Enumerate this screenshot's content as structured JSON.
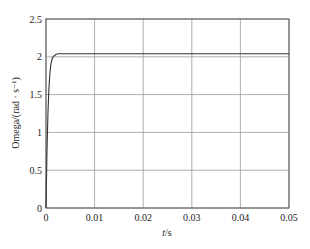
{
  "chart_data": {
    "type": "line",
    "title": "",
    "xlabel": "t/s",
    "xlabel_italic_part": "t",
    "xlabel_unit": "/s",
    "ylabel": "Omega/(rad · s⁻¹)",
    "xlim": [
      0,
      0.05
    ],
    "ylim": [
      0,
      2.5
    ],
    "grid": true,
    "legend": null,
    "xticks": [
      "0",
      "0.01",
      "0.02",
      "0.03",
      "0.04",
      "0.05"
    ],
    "yticks": [
      "0",
      "0.5",
      "1",
      "1.5",
      "2",
      "2.5"
    ],
    "series": [
      {
        "name": "Omega",
        "x": [
          0,
          0.0002,
          0.0004,
          0.0006,
          0.0008,
          0.001,
          0.0013,
          0.0016,
          0.002,
          0.0025,
          0.003,
          0.005,
          0.01,
          0.02,
          0.03,
          0.04,
          0.05
        ],
        "y": [
          0,
          0.75,
          1.25,
          1.58,
          1.78,
          1.9,
          1.98,
          2.01,
          2.03,
          2.04,
          2.04,
          2.04,
          2.04,
          2.04,
          2.04,
          2.04,
          2.04
        ]
      }
    ]
  },
  "colors": {
    "axis": "#555555",
    "grid": "#9a9a9a",
    "line": "#333333",
    "background": "#ffffff"
  }
}
